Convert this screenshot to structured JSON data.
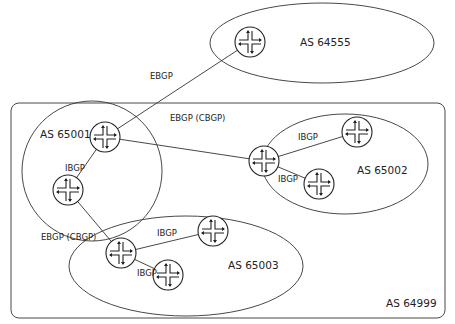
{
  "diagram": {
    "type": "bgp-confederation-topology",
    "colors": {
      "stroke": "#333333",
      "text": "#222222",
      "background": "#ffffff"
    },
    "outer_as": {
      "label": "AS 64999",
      "x": 11,
      "y": 103,
      "w": 434,
      "h": 215,
      "rx": 8,
      "label_x": 386,
      "label_y": 307
    },
    "autonomous_systems": [
      {
        "id": "as64555",
        "label": "AS 64555",
        "cx": 322,
        "cy": 43,
        "rx": 112,
        "ry": 40,
        "label_x": 300,
        "label_y": 46
      },
      {
        "id": "as65001",
        "label": "AS 65001",
        "cx": 92,
        "cy": 171,
        "rx": 70,
        "ry": 70,
        "label_x": 40,
        "label_y": 138
      },
      {
        "id": "as65002",
        "label": "AS 65002",
        "cx": 345,
        "cy": 164,
        "rx": 83,
        "ry": 50,
        "label_x": 357,
        "label_y": 174
      },
      {
        "id": "as65003",
        "label": "AS 65003",
        "cx": 186,
        "cy": 266,
        "rx": 117,
        "ry": 50,
        "label_x": 228,
        "label_y": 269
      }
    ],
    "routers": [
      {
        "id": "r64555",
        "as": "AS 64555",
        "x": 250,
        "y": 42
      },
      {
        "id": "r65001a",
        "as": "AS 65001",
        "x": 105,
        "y": 137
      },
      {
        "id": "r65001b",
        "as": "AS 65001",
        "x": 68,
        "y": 190
      },
      {
        "id": "r65002a",
        "as": "AS 65002",
        "x": 264,
        "y": 161
      },
      {
        "id": "r65002b",
        "as": "AS 65002",
        "x": 357,
        "y": 132
      },
      {
        "id": "r65002c",
        "as": "AS 65002",
        "x": 319,
        "y": 184
      },
      {
        "id": "r65003a",
        "as": "AS 65003",
        "x": 121,
        "y": 253
      },
      {
        "id": "r65003b",
        "as": "AS 65003",
        "x": 213,
        "y": 231
      },
      {
        "id": "r65003c",
        "as": "AS 65003",
        "x": 168,
        "y": 275
      }
    ],
    "links": [
      {
        "from": "r65001a",
        "to": "r64555",
        "label": "EBGP",
        "label_x": 150,
        "label_y": 79
      },
      {
        "from": "r65001a",
        "to": "r65002a",
        "label": "EBGP (CBGP)",
        "label_x": 170,
        "label_y": 121
      },
      {
        "from": "r65001a",
        "to": "r65001b",
        "label": "IBGP",
        "label_x": 65,
        "label_y": 171
      },
      {
        "from": "r65001b",
        "to": "r65003a",
        "label": "EBGP (CBGP)",
        "label_x": 41,
        "label_y": 240
      },
      {
        "from": "r65002a",
        "to": "r65002b",
        "label": "IBGP",
        "label_x": 298,
        "label_y": 140
      },
      {
        "from": "r65002a",
        "to": "r65002c",
        "label": "IBGP",
        "label_x": 278,
        "label_y": 182
      },
      {
        "from": "r65003a",
        "to": "r65003b",
        "label": "IBGP",
        "label_x": 157,
        "label_y": 236
      },
      {
        "from": "r65003a",
        "to": "r65003c",
        "label": "IBGP",
        "label_x": 137,
        "label_y": 276
      }
    ]
  }
}
